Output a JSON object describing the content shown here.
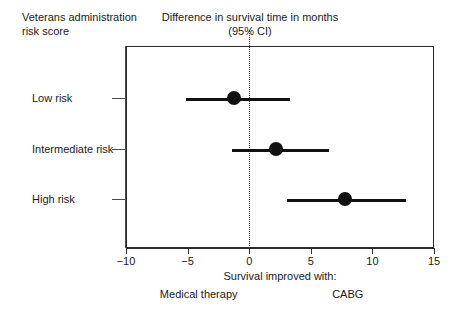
{
  "headers": {
    "left": "Veterans administration\nrisk score",
    "center_line1": "Difference in survival time in months",
    "center_line2": "(95% CI)"
  },
  "footer": {
    "main": "Survival improved with:",
    "left_side": "Medical therapy",
    "right_side": "CABG"
  },
  "chart_data": {
    "type": "scatter",
    "subtype": "forest-plot",
    "title": "Difference in survival time in months (95% CI)",
    "xlabel": "Survival improved with:",
    "ylabel": "Veterans administration risk score",
    "xlim": [
      -10,
      15
    ],
    "xticks": [
      -10,
      -5,
      0,
      5,
      10,
      15
    ],
    "xtick_labels": [
      "−10",
      "−5",
      "0",
      "5",
      "10",
      "15"
    ],
    "reference_line": 0,
    "reference_line_style": "dotted",
    "grid": false,
    "legend": "none",
    "categories": [
      "Low risk",
      "Intermediate risk",
      "High risk"
    ],
    "points": [
      {
        "label": "Low risk",
        "estimate": -1.2,
        "ci_low": -5.1,
        "ci_high": 3.3
      },
      {
        "label": "Intermediate risk",
        "estimate": 2.2,
        "ci_low": -1.4,
        "ci_high": 6.5
      },
      {
        "label": "High risk",
        "estimate": 7.8,
        "ci_low": 3.1,
        "ci_high": 12.7
      }
    ],
    "marker": "filled-circle",
    "marker_color": "#111111",
    "line_color": "#111111"
  }
}
